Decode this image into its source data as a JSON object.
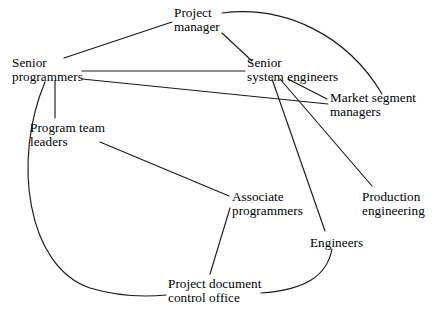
{
  "diagram": {
    "background_color": "#ffffff",
    "stroke_color": "#1a1a1a",
    "nodes": [
      {
        "id": "project_manager",
        "label": "Project manager",
        "line1": "Project",
        "line2": "manager",
        "x": 174,
        "y": 6
      },
      {
        "id": "senior_programmers",
        "label": "Senior programmers",
        "line1": "Senior",
        "line2": "programmers",
        "x": 12,
        "y": 56
      },
      {
        "id": "senior_system_eng",
        "label": "Senior system engineers",
        "line1": "Senior",
        "line2": "system engineers",
        "x": 247,
        "y": 56
      },
      {
        "id": "market_segment_mgrs",
        "label": "Market segment managers",
        "line1": "Market segment",
        "line2": "managers",
        "x": 330,
        "y": 91
      },
      {
        "id": "program_team_leaders",
        "label": "Program team leaders",
        "line1": "Program team",
        "line2": "leaders",
        "x": 30,
        "y": 121
      },
      {
        "id": "production_eng",
        "label": "Production engineering",
        "line1": "Production",
        "line2": "engineering",
        "x": 362,
        "y": 190
      },
      {
        "id": "associate_prog",
        "label": "Associate programmers",
        "line1": "Associate",
        "line2": "programmers",
        "x": 232,
        "y": 190
      },
      {
        "id": "engineers",
        "label": "Engineers",
        "line1": "Engineers",
        "line2": "",
        "x": 310,
        "y": 236
      },
      {
        "id": "project_doc_office",
        "label": "Project document control office",
        "line1": "Project document",
        "line2": "control office",
        "x": 168,
        "y": 277
      }
    ],
    "edges": [
      {
        "id": "e1",
        "from": "senior_programmers",
        "to": "project_manager",
        "type": "line"
      },
      {
        "id": "e2",
        "from": "project_manager",
        "to": "senior_system_eng",
        "type": "line"
      },
      {
        "id": "e3",
        "from": "project_manager",
        "to": "market_segment_mgrs",
        "type": "curve"
      },
      {
        "id": "e4",
        "from": "senior_programmers",
        "to": "senior_system_eng",
        "type": "line"
      },
      {
        "id": "e5",
        "from": "senior_programmers",
        "to": "market_segment_mgrs",
        "type": "line"
      },
      {
        "id": "e6",
        "from": "senior_system_eng",
        "to": "market_segment_mgrs",
        "type": "line"
      },
      {
        "id": "e7",
        "from": "senior_system_eng",
        "to": "production_eng",
        "type": "line"
      },
      {
        "id": "e8",
        "from": "senior_system_eng",
        "to": "engineers",
        "type": "line"
      },
      {
        "id": "e9",
        "from": "senior_programmers",
        "to": "program_team_leaders",
        "type": "line"
      },
      {
        "id": "e10",
        "from": "program_team_leaders",
        "to": "associate_prog",
        "type": "line"
      },
      {
        "id": "e11",
        "from": "associate_prog",
        "to": "project_doc_office",
        "type": "line"
      },
      {
        "id": "e12",
        "from": "engineers",
        "to": "project_doc_office",
        "type": "curve"
      },
      {
        "id": "e13",
        "from": "senior_programmers",
        "to": "project_doc_office",
        "type": "curve"
      }
    ]
  }
}
